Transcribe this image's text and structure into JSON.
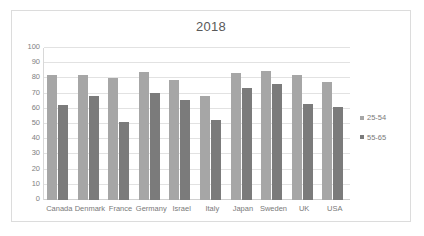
{
  "chart_data": {
    "type": "bar",
    "title": "2018",
    "xlabel": "",
    "ylabel": "",
    "ylim": [
      0,
      100
    ],
    "yticks": [
      "0",
      "10",
      "20",
      "30",
      "40",
      "50",
      "60",
      "70",
      "80",
      "90",
      "100"
    ],
    "grid": true,
    "legend_position": "right",
    "categories": [
      "Canada",
      "Denmark",
      "France",
      "Germany",
      "Israel",
      "Italy",
      "Japan",
      "Sweden",
      "UK",
      "USA"
    ],
    "series": [
      {
        "name": "25-54",
        "color": "#a6a6a6",
        "values": [
          82.5,
          82,
          80,
          84,
          79,
          68.5,
          83.5,
          85,
          82,
          77.5
        ]
      },
      {
        "name": "55-65",
        "color": "#7b7b7b",
        "values": [
          62.5,
          68.5,
          51.5,
          70.5,
          66,
          52.5,
          73.5,
          76.5,
          63,
          61
        ]
      }
    ]
  },
  "legend": {
    "items": [
      {
        "label": "25-54",
        "color": "#a6a6a6"
      },
      {
        "label": "55-65",
        "color": "#7b7b7b"
      }
    ]
  }
}
